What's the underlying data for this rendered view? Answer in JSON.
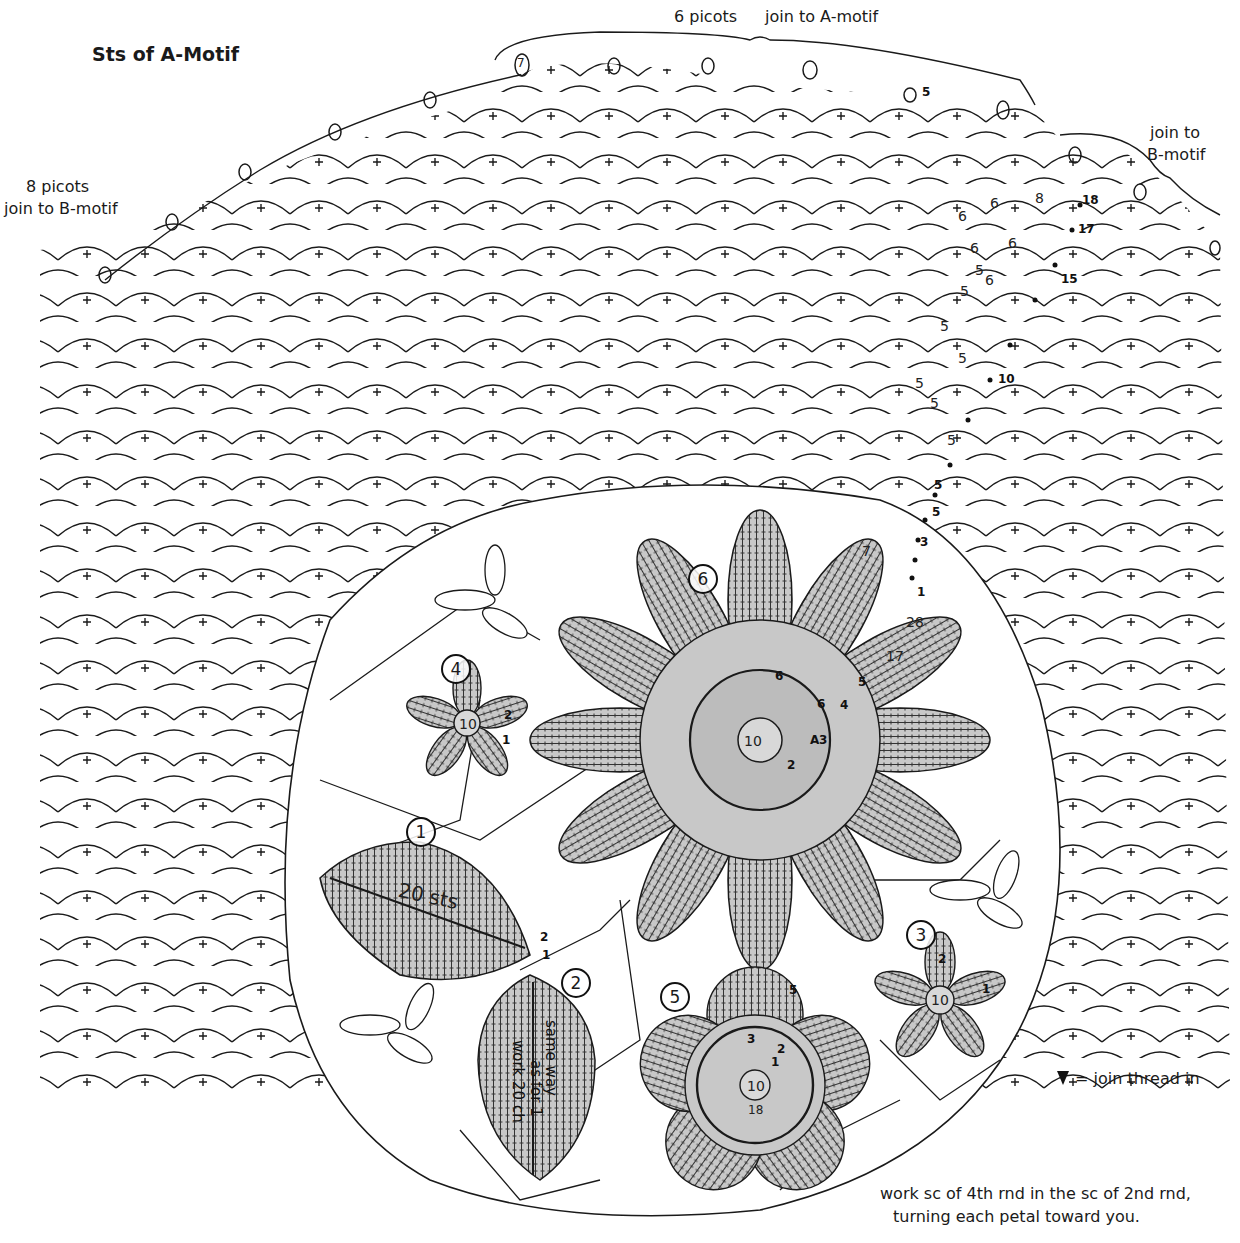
{
  "diagram": {
    "title": "Sts of A-Motif",
    "annotations": {
      "top_left_picots": "8 picots",
      "top_left_join": "join to B-motif",
      "top_center_picots": "6 picots",
      "top_center_join": "join to A-motif",
      "top_right_join_line1": "join to",
      "top_right_join_line2": "B-motif",
      "legend_symbol": "join-thread-triangle",
      "legend_text": "= join thread in",
      "bottom_note_line1": "work sc of 4th rnd in the sc of 2nd rnd,",
      "bottom_note_line2": "turning each petal toward you."
    },
    "motifs": [
      {
        "id": "1",
        "label": "1",
        "center_text": "20 sts",
        "row_labels": [
          "2",
          "1"
        ]
      },
      {
        "id": "2",
        "label": "2",
        "text_line1": "same way",
        "text_line2": "as for 1",
        "text_line3": "work 20 ch"
      },
      {
        "id": "3",
        "label": "3",
        "center": "10",
        "row_labels": [
          "2",
          "1"
        ]
      },
      {
        "id": "4",
        "label": "4",
        "center": "10",
        "row_labels": [
          "2",
          "1"
        ]
      },
      {
        "id": "5",
        "label": "5",
        "center": "10",
        "inner_count": "18",
        "row_labels": [
          "5",
          "3",
          "2",
          "1"
        ]
      },
      {
        "id": "6",
        "label": "6",
        "center": "10",
        "row_labels": [
          "6",
          "6",
          "5",
          "4",
          "3",
          "2"
        ],
        "start_marker": "A"
      }
    ],
    "row_numbers": {
      "r1": "1",
      "r3": "3",
      "r5a": "5",
      "r5b": "5",
      "r7": "7",
      "r10": "10",
      "r15": "15",
      "r17": "17",
      "r18": "18",
      "r28": "28",
      "r17b": "17"
    },
    "chain_counts": [
      "5",
      "5",
      "5",
      "5",
      "5",
      "5",
      "5",
      "6",
      "6",
      "6",
      "6",
      "6",
      "8",
      "7",
      "5"
    ],
    "colors": {
      "line": "#1a1a1a",
      "motif_fill": "#c8c8c8",
      "background": "#ffffff"
    }
  }
}
